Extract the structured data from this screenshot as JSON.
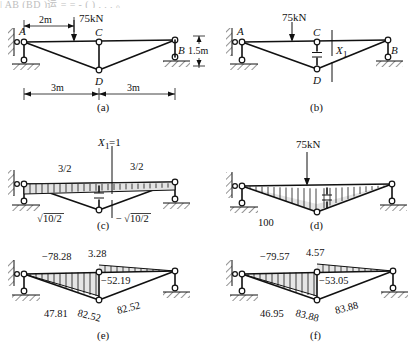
{
  "figure": {
    "top_fragment": "| AB (BD )运 =        = -    (  )  ,    ,  ,   。",
    "panels": [
      {
        "id": "a",
        "caption": "(a)"
      },
      {
        "id": "b",
        "caption": "(b)"
      },
      {
        "id": "c",
        "caption": "(c)"
      },
      {
        "id": "d",
        "caption": "(d)"
      },
      {
        "id": "e",
        "caption": "(e)"
      },
      {
        "id": "f",
        "caption": "(f)"
      }
    ]
  },
  "panel_a": {
    "caption": "(a)",
    "nodes": {
      "A": "A",
      "B": "B",
      "C": "C",
      "D": "D"
    },
    "load_label": "75kN",
    "dim_offset": "2m",
    "dim_left": "3m",
    "dim_right": "3m",
    "dim_height": "1.5m"
  },
  "panel_b": {
    "caption": "(b)",
    "nodes": {
      "A": "A",
      "B": "B",
      "C": "C",
      "D": "D"
    },
    "load_label": "75kN",
    "redundant_label": "X",
    "redundant_sub": "1"
  },
  "panel_c": {
    "caption": "(c)",
    "unit_load_label": "X",
    "unit_load_sub": "1",
    "unit_load_value": "=1",
    "top_left_value": "3/2",
    "top_right_value": "3/2",
    "diag_left_value": "10/2",
    "diag_left_prefix": "",
    "diag_right_value": "10/2",
    "diag_right_prefix": "−",
    "radical": "√"
  },
  "panel_d": {
    "caption": "(d)",
    "load_label": "75kN",
    "bottom_value": "100"
  },
  "panel_e": {
    "caption": "(e)",
    "top_chord_value": "−78.28",
    "peak_value": "3.28",
    "right_top_value": "−52.19",
    "diag_left_value": "47.81",
    "bottom_left_value": "82.52",
    "bottom_right_value": "82.52"
  },
  "panel_f": {
    "caption": "(f)",
    "top_chord_value": "−79.57",
    "peak_value": "4.57",
    "right_top_value": "−53.05",
    "diag_left_value": "46.95",
    "bottom_left_value": "83.88",
    "bottom_right_value": "83.88"
  },
  "colors": {
    "ink": "#111111",
    "paper": "#ffffff",
    "fill": "#cfcfcf"
  }
}
